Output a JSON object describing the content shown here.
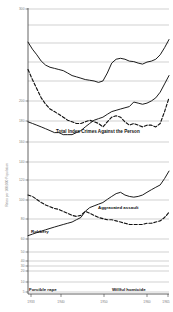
{
  "chart_data": {
    "type": "line",
    "title": "",
    "subtitle": "",
    "xlabel": "",
    "ylabel": "Rates per 100,000 Population",
    "yscale": "log",
    "ylim": [
      1,
      300
    ],
    "xlim": [
      1933,
      1965
    ],
    "grid": true,
    "legend_position": "inline-annotations",
    "x_ticks": [
      "1933",
      "1940",
      "1950",
      "1960",
      "1965"
    ],
    "x_tick_values": [
      1933,
      1940,
      1950,
      1960,
      1965
    ],
    "y_ticks": [
      "300",
      "200",
      "180",
      "160",
      "140",
      "120",
      "100",
      "80",
      "60",
      "50",
      "40",
      "30",
      "20",
      "10",
      "5",
      "3",
      "2",
      "1"
    ],
    "y_tick_values": [
      300,
      200,
      180,
      160,
      140,
      120,
      100,
      80,
      60,
      50,
      40,
      30,
      20,
      10,
      5,
      3,
      2,
      1
    ],
    "annotations": [
      "Total Index Crimes Against the Person",
      "Aggravated assault",
      "Robbery",
      "Forcible rape",
      "Willful homicide"
    ],
    "x": [
      1933,
      1934,
      1935,
      1936,
      1937,
      1938,
      1939,
      1940,
      1941,
      1942,
      1943,
      1944,
      1945,
      1946,
      1947,
      1948,
      1949,
      1950,
      1951,
      1952,
      1953,
      1954,
      1955,
      1956,
      1957,
      1958,
      1959,
      1960,
      1961,
      1962,
      1963,
      1964,
      1965
    ],
    "series": [
      {
        "name": "Total Index Crimes Against the Person",
        "style": "solid",
        "values": [
          152,
          132,
          118,
          104,
          96,
          92,
          90,
          88,
          86,
          82,
          78,
          76,
          74,
          72,
          71,
          70,
          68,
          70,
          82,
          100,
          108,
          110,
          108,
          104,
          103,
          100,
          98,
          102,
          104,
          108,
          118,
          136,
          160
        ]
      },
      {
        "name": "Aggravated assault",
        "style": "solid",
        "values": [
          31,
          30,
          29,
          28,
          27,
          26,
          25,
          25,
          24,
          24,
          24,
          25,
          26,
          28,
          30,
          32,
          33,
          34,
          36,
          38,
          39,
          40,
          41,
          42,
          46,
          45,
          44,
          45,
          47,
          50,
          56,
          66,
          78
        ]
      },
      {
        "name": "Robbery",
        "style": "dashed",
        "values": [
          88,
          72,
          60,
          50,
          44,
          40,
          38,
          36,
          34,
          32,
          31,
          30,
          30,
          31,
          32,
          31,
          30,
          28,
          31,
          34,
          35,
          34,
          31,
          29,
          30,
          29,
          28,
          29,
          29,
          28,
          30,
          38,
          50
        ]
      },
      {
        "name": "Forcible rape",
        "style": "solid",
        "values": [
          3.2,
          3.3,
          3.4,
          3.5,
          3.6,
          3.7,
          3.8,
          3.9,
          4.0,
          4.1,
          4.2,
          4.4,
          4.6,
          5.2,
          5.6,
          5.8,
          6.0,
          6.2,
          6.6,
          7.0,
          7.4,
          7.6,
          7.2,
          7.0,
          6.9,
          7.0,
          7.2,
          7.6,
          8.0,
          8.4,
          8.8,
          10.0,
          11.6
        ]
      },
      {
        "name": "Willful homicide",
        "style": "dashed",
        "values": [
          7.2,
          7.0,
          6.6,
          6.2,
          5.9,
          5.7,
          5.5,
          5.4,
          5.2,
          5.0,
          4.8,
          4.7,
          4.8,
          5.2,
          5.0,
          4.8,
          4.6,
          4.5,
          4.4,
          4.4,
          4.3,
          4.2,
          4.1,
          4.0,
          4.0,
          4.0,
          4.0,
          4.1,
          4.1,
          4.2,
          4.3,
          4.6,
          5.1
        ]
      }
    ]
  },
  "annotations": {
    "total_label": "Total Index Crimes Against the Person",
    "assault_label": "Aggravated assault",
    "robbery_label": "Robbery",
    "rape_label": "Forcible rape",
    "homicide_label": "Willful homicide"
  },
  "axis": {
    "y_title": "Rates per 100,000 Population",
    "y_labels": {
      "t300": "300",
      "t200": "200",
      "t180": "180",
      "t160": "160",
      "t140": "140",
      "t120": "120",
      "t100": "100",
      "t80": "80",
      "t60": "60",
      "t50": "50",
      "t40": "40",
      "t30": "30",
      "t20": "20",
      "t10": "10",
      "t5": "5",
      "t3": "3",
      "t2": "2",
      "t1": "1"
    },
    "x_labels": {
      "x1933": "1933",
      "x1940": "1940",
      "x1950": "1950",
      "x1960": "1960",
      "x1965": "1965"
    }
  },
  "colors": {
    "line": "#101010",
    "grid": "#9a9a9a",
    "axis": "#3c3c3c",
    "tick_text": "#7d7d7d",
    "label_text": "#111111",
    "background": "#ffffff"
  }
}
